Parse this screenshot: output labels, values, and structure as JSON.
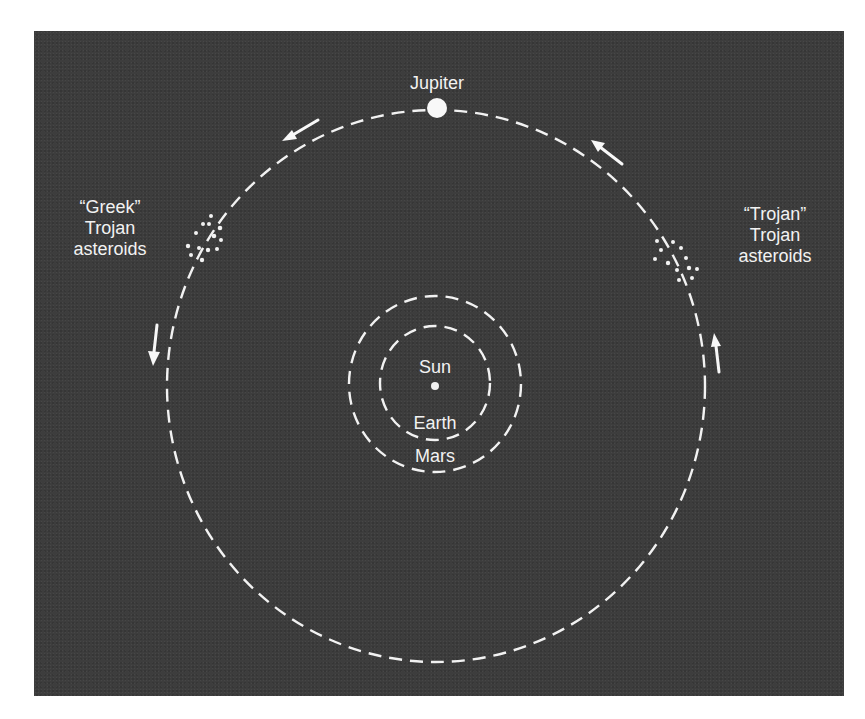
{
  "diagram": {
    "colors": {
      "background": "#3d3d3d",
      "foreground": "#f2f2f2",
      "page": "#ffffff"
    },
    "labels": {
      "jupiter": "Jupiter",
      "sun": "Sun",
      "earth": "Earth",
      "mars": "Mars",
      "greek_group": "“Greek”\nTrojan\nasteroids",
      "trojan_group": "“Trojan”\nTrojan\nasteroids"
    },
    "bodies": [
      {
        "name": "Sun",
        "icon": "sun-dot-icon"
      },
      {
        "name": "Earth",
        "icon": "dashed-orbit"
      },
      {
        "name": "Mars",
        "icon": "dashed-orbit"
      },
      {
        "name": "Jupiter",
        "icon": "planet-dot-icon"
      }
    ],
    "asteroid_groups": [
      {
        "name": "Greek",
        "position": "leading (left of Jupiter, L4)"
      },
      {
        "name": "Trojan",
        "position": "trailing (right of Jupiter, L5)"
      }
    ],
    "motion": "counter-clockwise",
    "arrows": [
      {
        "location": "top-left",
        "direction": "left-down"
      },
      {
        "location": "top-right",
        "direction": "up-left"
      },
      {
        "location": "left",
        "direction": "down"
      },
      {
        "location": "right",
        "direction": "up"
      }
    ]
  }
}
